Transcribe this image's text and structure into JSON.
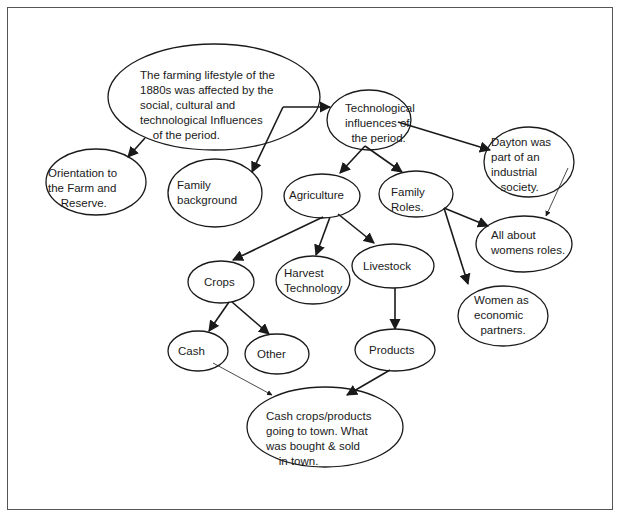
{
  "diagram": {
    "type": "concept-map",
    "nodes": [
      {
        "id": "root",
        "label": "The farming lifestyle of the\n1880s was affected by the\nsocial, cultural and\ntechnological Influences\n    of the period."
      },
      {
        "id": "tech",
        "label": "Technological\ninfluences of\n  the period."
      },
      {
        "id": "dayton",
        "label": "Dayton was\npart of an\nindustrial\n   society."
      },
      {
        "id": "orientation",
        "label": "Orientation to\nthe Farm and\n    Reserve."
      },
      {
        "id": "family-background",
        "label": "Family\nbackground"
      },
      {
        "id": "agriculture",
        "label": "Agriculture"
      },
      {
        "id": "family-roles",
        "label": "Family\nRoles."
      },
      {
        "id": "womens-roles",
        "label": "All about\nwomens roles."
      },
      {
        "id": "crops",
        "label": "Crops"
      },
      {
        "id": "harvest",
        "label": "Harvest\nTechnology"
      },
      {
        "id": "livestock",
        "label": "Livestock"
      },
      {
        "id": "women-partners",
        "label": "Women as\neconomic\n  partners."
      },
      {
        "id": "cash",
        "label": "Cash"
      },
      {
        "id": "other",
        "label": "Other"
      },
      {
        "id": "products",
        "label": "Products"
      },
      {
        "id": "town",
        "label": "Cash crops/products\ngoing to town. What\nwas bought & sold\n    in town."
      }
    ],
    "edges": [
      {
        "from": "root",
        "to": "tech"
      },
      {
        "from": "root",
        "to": "orientation"
      },
      {
        "from": "root",
        "to": "family-background"
      },
      {
        "from": "tech",
        "to": "dayton"
      },
      {
        "from": "tech",
        "to": "agriculture"
      },
      {
        "from": "tech",
        "to": "family-roles"
      },
      {
        "from": "dayton",
        "to": "womens-roles"
      },
      {
        "from": "family-roles",
        "to": "womens-roles"
      },
      {
        "from": "family-roles",
        "to": "women-partners"
      },
      {
        "from": "agriculture",
        "to": "crops"
      },
      {
        "from": "agriculture",
        "to": "harvest"
      },
      {
        "from": "agriculture",
        "to": "livestock"
      },
      {
        "from": "crops",
        "to": "cash"
      },
      {
        "from": "crops",
        "to": "other"
      },
      {
        "from": "livestock",
        "to": "products"
      },
      {
        "from": "cash",
        "to": "town"
      },
      {
        "from": "products",
        "to": "town"
      }
    ]
  }
}
